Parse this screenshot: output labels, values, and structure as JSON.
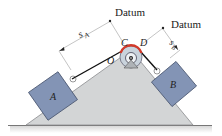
{
  "diagram": {
    "labels": {
      "datum_left": "Datum",
      "datum_right": "Datum",
      "point_c": "C",
      "point_d": "D",
      "point_o": "O",
      "block_a": "A",
      "block_b": "B",
      "s_a_main": "s",
      "s_a_sub": "A",
      "s_b_main": "s",
      "s_b_sub": "B"
    },
    "colors": {
      "block_fill": "#8394b5",
      "block_stroke": "#4a5670",
      "incline_fill": "#d3d5d6",
      "pulley_fill": "#c9d3dc",
      "contact_arc": "#d23a2a",
      "ground": "#666666"
    }
  }
}
